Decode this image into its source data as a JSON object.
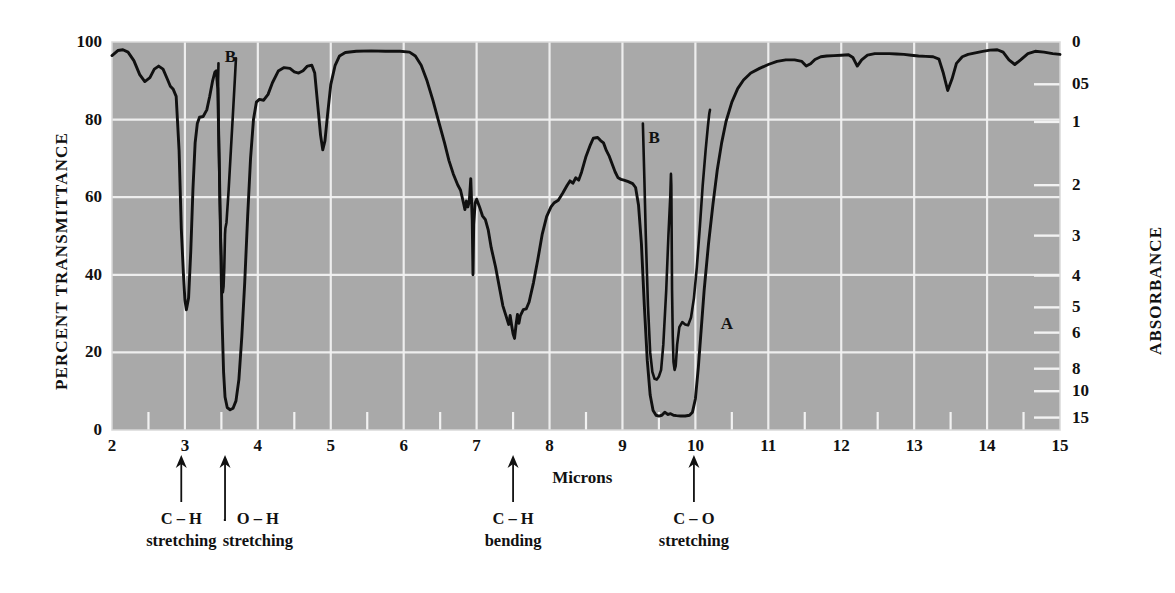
{
  "chart_data": {
    "type": "line",
    "title": "",
    "xlabel": "Microns",
    "ylabel": "PERCENT TRANSMITTANCE",
    "y2label": "ABSORBANCE",
    "xlim": [
      2,
      15
    ],
    "ylim": [
      0,
      100
    ],
    "grid": true,
    "plot_bg": "#a9a9a9",
    "grid_color": "#f2f2f2",
    "curve_color": "#101010",
    "x_ticks": [
      "2",
      "3",
      "4",
      "5",
      "6",
      "7",
      "8",
      "9",
      "10",
      "11",
      "12",
      "13",
      "14",
      "15"
    ],
    "x_minor_step": 0.5,
    "y_ticks": [
      "0",
      "20",
      "40",
      "60",
      "80",
      "100"
    ],
    "absorbance_ticks": [
      {
        "label": "0",
        "transmittance": 100
      },
      {
        "label": "05",
        "transmittance": 89.1
      },
      {
        "label": "1",
        "transmittance": 79.4
      },
      {
        "label": "2",
        "transmittance": 63.1
      },
      {
        "label": "3",
        "transmittance": 50.1
      },
      {
        "label": "4",
        "transmittance": 39.8
      },
      {
        "label": "5",
        "transmittance": 31.6
      },
      {
        "label": "6",
        "transmittance": 25.1
      },
      {
        "label": "8",
        "transmittance": 15.8
      },
      {
        "label": "10",
        "transmittance": 10.0
      },
      {
        "label": "15",
        "transmittance": 3.2
      }
    ],
    "series": [
      {
        "name": "A",
        "label": "A",
        "label_at": {
          "x": 10.32,
          "y": 27
        },
        "points": [
          [
            2.0,
            96.5
          ],
          [
            2.08,
            97.8
          ],
          [
            2.15,
            98.0
          ],
          [
            2.22,
            97.4
          ],
          [
            2.3,
            95.2
          ],
          [
            2.38,
            91.6
          ],
          [
            2.45,
            89.8
          ],
          [
            2.52,
            90.8
          ],
          [
            2.58,
            93.0
          ],
          [
            2.64,
            93.8
          ],
          [
            2.7,
            93.0
          ],
          [
            2.76,
            90.4
          ],
          [
            2.8,
            88.6
          ],
          [
            2.84,
            87.8
          ],
          [
            2.88,
            86.0
          ],
          [
            2.92,
            72.0
          ],
          [
            2.95,
            52.0
          ],
          [
            2.98,
            40.0
          ],
          [
            3.0,
            33.5
          ],
          [
            3.02,
            31.0
          ],
          [
            3.05,
            34.0
          ],
          [
            3.08,
            46.0
          ],
          [
            3.11,
            62.0
          ],
          [
            3.14,
            74.0
          ],
          [
            3.17,
            79.0
          ],
          [
            3.2,
            80.6
          ],
          [
            3.25,
            80.8
          ],
          [
            3.3,
            82.5
          ],
          [
            3.34,
            86.0
          ],
          [
            3.38,
            90.0
          ],
          [
            3.41,
            92.2
          ],
          [
            3.43,
            92.6
          ],
          [
            3.45,
            88.0
          ],
          [
            3.47,
            70.0
          ],
          [
            3.49,
            48.0
          ],
          [
            3.51,
            28.0
          ],
          [
            3.53,
            15.0
          ],
          [
            3.55,
            8.5
          ],
          [
            3.58,
            5.8
          ],
          [
            3.62,
            5.2
          ],
          [
            3.66,
            5.6
          ],
          [
            3.7,
            7.5
          ],
          [
            3.74,
            13.0
          ],
          [
            3.78,
            24.0
          ],
          [
            3.82,
            38.0
          ],
          [
            3.86,
            55.0
          ],
          [
            3.9,
            70.0
          ],
          [
            3.94,
            80.0
          ],
          [
            3.98,
            84.5
          ],
          [
            4.02,
            85.2
          ],
          [
            4.08,
            85.0
          ],
          [
            4.14,
            86.5
          ],
          [
            4.2,
            89.5
          ],
          [
            4.28,
            92.5
          ],
          [
            4.36,
            93.4
          ],
          [
            4.44,
            93.2
          ],
          [
            4.5,
            92.3
          ],
          [
            4.56,
            92.0
          ],
          [
            4.62,
            92.6
          ],
          [
            4.68,
            93.8
          ],
          [
            4.74,
            94.0
          ],
          [
            4.78,
            92.0
          ],
          [
            4.82,
            84.0
          ],
          [
            4.86,
            76.0
          ],
          [
            4.89,
            72.2
          ],
          [
            4.92,
            74.5
          ],
          [
            4.96,
            82.0
          ],
          [
            5.0,
            89.0
          ],
          [
            5.06,
            94.0
          ],
          [
            5.12,
            96.4
          ],
          [
            5.2,
            97.3
          ],
          [
            5.35,
            97.6
          ],
          [
            5.55,
            97.7
          ],
          [
            5.75,
            97.6
          ],
          [
            5.95,
            97.6
          ],
          [
            6.08,
            97.4
          ],
          [
            6.16,
            96.4
          ],
          [
            6.24,
            94.0
          ],
          [
            6.32,
            90.0
          ],
          [
            6.4,
            85.0
          ],
          [
            6.48,
            79.5
          ],
          [
            6.56,
            74.0
          ],
          [
            6.62,
            69.5
          ],
          [
            6.68,
            66.0
          ],
          [
            6.74,
            63.2
          ],
          [
            6.78,
            61.8
          ],
          [
            6.82,
            58.5
          ],
          [
            6.84,
            56.8
          ],
          [
            6.86,
            59.0
          ],
          [
            6.88,
            57.5
          ],
          [
            6.9,
            59.0
          ],
          [
            6.92,
            64.8
          ],
          [
            6.94,
            54.0
          ],
          [
            6.95,
            40.0
          ],
          [
            6.96,
            53.0
          ],
          [
            6.98,
            58.5
          ],
          [
            7.0,
            59.5
          ],
          [
            7.04,
            57.5
          ],
          [
            7.08,
            55.2
          ],
          [
            7.12,
            54.2
          ],
          [
            7.16,
            51.5
          ],
          [
            7.2,
            47.0
          ],
          [
            7.26,
            42.0
          ],
          [
            7.32,
            36.0
          ],
          [
            7.36,
            32.0
          ],
          [
            7.4,
            29.6
          ],
          [
            7.44,
            27.2
          ],
          [
            7.46,
            29.5
          ],
          [
            7.48,
            27.0
          ],
          [
            7.5,
            24.8
          ],
          [
            7.52,
            23.6
          ],
          [
            7.54,
            27.0
          ],
          [
            7.56,
            29.8
          ],
          [
            7.58,
            27.5
          ],
          [
            7.6,
            29.5
          ],
          [
            7.64,
            31.0
          ],
          [
            7.68,
            31.2
          ],
          [
            7.72,
            33.0
          ],
          [
            7.78,
            38.0
          ],
          [
            7.84,
            44.0
          ],
          [
            7.9,
            50.5
          ],
          [
            7.96,
            55.0
          ],
          [
            8.02,
            57.5
          ],
          [
            8.06,
            58.5
          ],
          [
            8.12,
            59.2
          ],
          [
            8.18,
            61.0
          ],
          [
            8.24,
            63.0
          ],
          [
            8.28,
            64.2
          ],
          [
            8.32,
            63.6
          ],
          [
            8.36,
            65.0
          ],
          [
            8.4,
            64.4
          ],
          [
            8.44,
            66.5
          ],
          [
            8.5,
            70.5
          ],
          [
            8.56,
            73.5
          ],
          [
            8.6,
            75.2
          ],
          [
            8.66,
            75.4
          ],
          [
            8.7,
            74.6
          ],
          [
            8.74,
            74.0
          ],
          [
            8.78,
            72.0
          ],
          [
            8.82,
            70.5
          ],
          [
            8.86,
            68.5
          ],
          [
            8.9,
            66.5
          ],
          [
            8.94,
            65.0
          ],
          [
            8.98,
            64.6
          ],
          [
            9.02,
            64.4
          ],
          [
            9.08,
            64.0
          ],
          [
            9.14,
            63.5
          ],
          [
            9.18,
            62.5
          ],
          [
            9.22,
            58.0
          ],
          [
            9.26,
            48.0
          ],
          [
            9.3,
            32.0
          ],
          [
            9.34,
            18.0
          ],
          [
            9.38,
            9.0
          ],
          [
            9.42,
            5.0
          ],
          [
            9.46,
            3.8
          ],
          [
            9.5,
            3.6
          ],
          [
            9.54,
            3.8
          ],
          [
            9.58,
            4.6
          ],
          [
            9.62,
            4.0
          ],
          [
            9.66,
            4.2
          ],
          [
            9.7,
            3.8
          ],
          [
            9.74,
            3.7
          ],
          [
            9.8,
            3.6
          ],
          [
            9.86,
            3.6
          ],
          [
            9.92,
            3.8
          ],
          [
            9.96,
            4.6
          ],
          [
            10.0,
            8.0
          ],
          [
            10.04,
            16.0
          ],
          [
            10.08,
            26.0
          ],
          [
            10.12,
            36.0
          ],
          [
            10.18,
            48.0
          ],
          [
            10.24,
            58.0
          ],
          [
            10.3,
            67.0
          ],
          [
            10.36,
            74.0
          ],
          [
            10.42,
            79.5
          ],
          [
            10.5,
            84.5
          ],
          [
            10.58,
            88.0
          ],
          [
            10.66,
            90.2
          ],
          [
            10.76,
            92.0
          ],
          [
            10.88,
            93.2
          ],
          [
            11.0,
            94.2
          ],
          [
            11.12,
            95.0
          ],
          [
            11.24,
            95.4
          ],
          [
            11.36,
            95.4
          ],
          [
            11.46,
            95.0
          ],
          [
            11.52,
            93.8
          ],
          [
            11.58,
            94.4
          ],
          [
            11.64,
            95.5
          ],
          [
            11.72,
            96.2
          ],
          [
            11.8,
            96.4
          ],
          [
            11.9,
            96.5
          ],
          [
            12.0,
            96.6
          ],
          [
            12.1,
            96.7
          ],
          [
            12.16,
            96.0
          ],
          [
            12.22,
            93.8
          ],
          [
            12.28,
            95.4
          ],
          [
            12.36,
            96.6
          ],
          [
            12.46,
            97.0
          ],
          [
            12.56,
            97.0
          ],
          [
            12.66,
            97.0
          ],
          [
            12.76,
            96.9
          ],
          [
            12.86,
            96.8
          ],
          [
            12.96,
            96.6
          ],
          [
            13.06,
            96.4
          ],
          [
            13.16,
            96.3
          ],
          [
            13.26,
            96.2
          ],
          [
            13.34,
            95.6
          ],
          [
            13.4,
            92.0
          ],
          [
            13.46,
            87.5
          ],
          [
            13.52,
            90.5
          ],
          [
            13.58,
            94.5
          ],
          [
            13.66,
            96.2
          ],
          [
            13.74,
            96.8
          ],
          [
            13.84,
            97.2
          ],
          [
            13.94,
            97.6
          ],
          [
            14.04,
            97.9
          ],
          [
            14.14,
            98.0
          ],
          [
            14.22,
            97.4
          ],
          [
            14.3,
            95.4
          ],
          [
            14.38,
            94.2
          ],
          [
            14.46,
            95.4
          ],
          [
            14.56,
            97.0
          ],
          [
            14.66,
            97.6
          ],
          [
            14.78,
            97.4
          ],
          [
            14.9,
            97.0
          ],
          [
            15.0,
            96.8
          ]
        ]
      },
      {
        "name": "B-ch-stretch",
        "label": "B",
        "label_at": {
          "x": 3.52,
          "y": 96
        },
        "points": [
          [
            3.46,
            94.5
          ],
          [
            3.455,
            90.0
          ],
          [
            3.46,
            80.0
          ],
          [
            3.47,
            68.0
          ],
          [
            3.48,
            58.0
          ],
          [
            3.49,
            50.0
          ],
          [
            3.5,
            44.0
          ],
          [
            3.505,
            40.0
          ],
          [
            3.51,
            37.5
          ],
          [
            3.515,
            36.2
          ],
          [
            3.52,
            35.5
          ],
          [
            3.53,
            37.0
          ],
          [
            3.54,
            42.0
          ],
          [
            3.55,
            50.5
          ],
          [
            3.555,
            52.0
          ],
          [
            3.57,
            53.5
          ],
          [
            3.6,
            62.0
          ],
          [
            3.63,
            72.0
          ],
          [
            3.66,
            82.0
          ],
          [
            3.685,
            90.5
          ],
          [
            3.7,
            95.8
          ]
        ]
      },
      {
        "name": "B-co-stretch",
        "label": "B",
        "label_at": {
          "x": 9.33,
          "y": 75
        },
        "points": [
          [
            9.28,
            79.0
          ],
          [
            9.3,
            65.0
          ],
          [
            9.32,
            50.0
          ],
          [
            9.35,
            32.0
          ],
          [
            9.38,
            20.0
          ],
          [
            9.41,
            15.0
          ],
          [
            9.44,
            13.2
          ],
          [
            9.47,
            13.0
          ],
          [
            9.5,
            13.8
          ],
          [
            9.53,
            15.5
          ],
          [
            9.56,
            22.0
          ],
          [
            9.6,
            36.0
          ],
          [
            9.63,
            50.0
          ],
          [
            9.655,
            60.0
          ],
          [
            9.665,
            66.0
          ],
          [
            9.67,
            63.0
          ],
          [
            9.675,
            50.0
          ],
          [
            9.68,
            36.0
          ],
          [
            9.69,
            24.0
          ],
          [
            9.7,
            17.5
          ],
          [
            9.715,
            15.5
          ],
          [
            9.73,
            16.5
          ],
          [
            9.75,
            22.0
          ],
          [
            9.78,
            26.5
          ],
          [
            9.82,
            27.8
          ],
          [
            9.86,
            27.2
          ],
          [
            9.9,
            27.0
          ],
          [
            9.94,
            29.0
          ],
          [
            9.98,
            34.0
          ],
          [
            10.02,
            42.0
          ],
          [
            10.06,
            52.0
          ],
          [
            10.1,
            63.0
          ],
          [
            10.14,
            72.0
          ],
          [
            10.17,
            78.0
          ],
          [
            10.19,
            81.5
          ],
          [
            10.2,
            82.5
          ]
        ]
      }
    ],
    "annotations": [
      {
        "id": "ch-stretching",
        "lines": [
          "C – H",
          "stretching"
        ],
        "arrow_x": 2.95,
        "text_x": 2.95,
        "elbow": false
      },
      {
        "id": "oh-stretching",
        "lines": [
          "O – H",
          "stretching"
        ],
        "arrow_x": 3.55,
        "text_x": 4.0,
        "elbow": true
      },
      {
        "id": "ch-bending",
        "lines": [
          "C – H",
          "bending"
        ],
        "arrow_x": 7.5,
        "text_x": 7.5,
        "elbow": false
      },
      {
        "id": "co-stretching",
        "lines": [
          "C – O",
          "stretching"
        ],
        "arrow_x": 9.98,
        "text_x": 9.98,
        "elbow": false
      }
    ]
  }
}
